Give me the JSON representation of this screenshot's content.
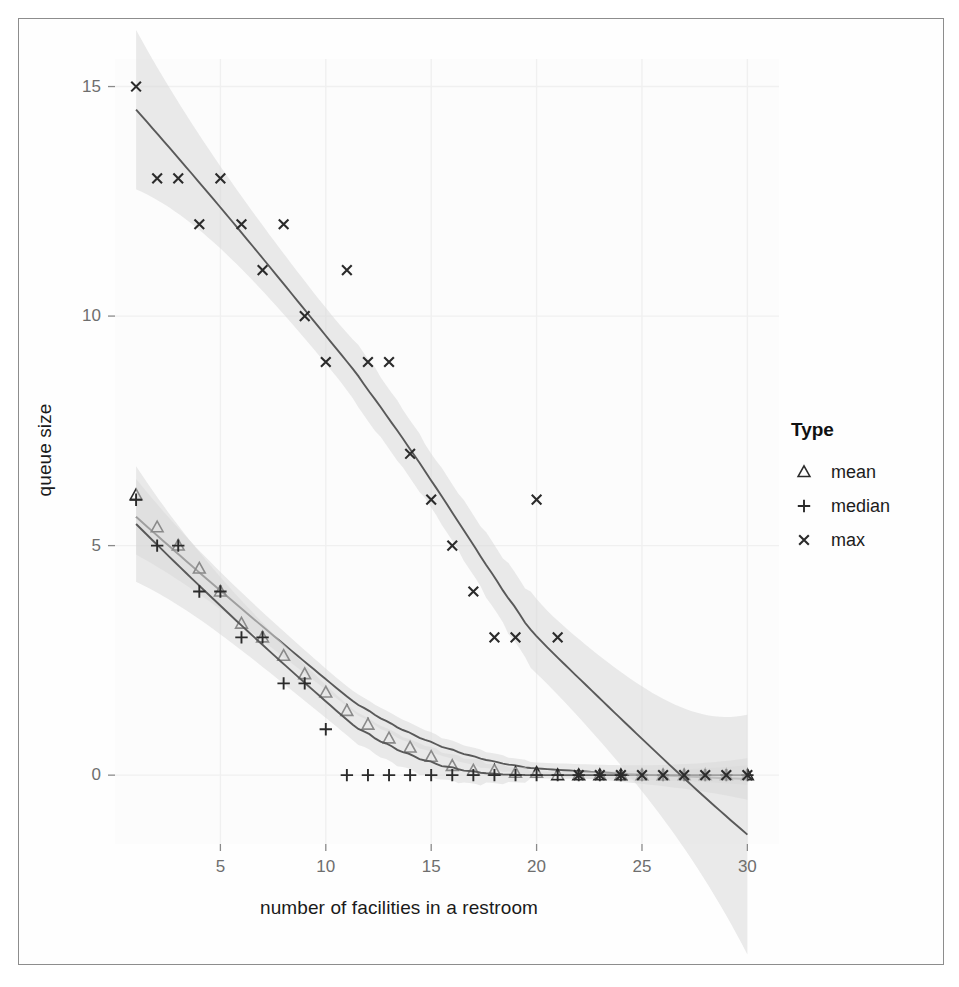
{
  "chart_data": {
    "type": "scatter",
    "title": "",
    "xlabel": "number of facilities in a restroom",
    "ylabel": "queue size",
    "xlim": [
      0,
      31.5
    ],
    "ylim": [
      -1.5,
      15.6
    ],
    "xticks": [
      5,
      10,
      15,
      20,
      25,
      30
    ],
    "yticks": [
      0,
      5,
      10,
      15
    ],
    "grid": true,
    "legend": {
      "title": "Type",
      "position": "right",
      "entries": [
        {
          "label": "mean",
          "marker": "triangle"
        },
        {
          "label": "median",
          "marker": "plus"
        },
        {
          "label": "max",
          "marker": "cross"
        }
      ]
    },
    "x": [
      1,
      2,
      3,
      4,
      5,
      6,
      7,
      8,
      9,
      10,
      11,
      12,
      13,
      14,
      15,
      16,
      17,
      18,
      19,
      20,
      21,
      22,
      23,
      24,
      25,
      26,
      27,
      28,
      29,
      30
    ],
    "series": [
      {
        "name": "mean",
        "marker": "triangle",
        "values": [
          6.1,
          5.4,
          5.0,
          4.5,
          4.0,
          3.3,
          3.0,
          2.6,
          2.2,
          1.8,
          1.4,
          1.1,
          0.8,
          0.6,
          0.4,
          0.2,
          0.1,
          0.1,
          0.05,
          0.05,
          0,
          0,
          0,
          0,
          0,
          0,
          0,
          0,
          0,
          0
        ],
        "smooth_line": true,
        "confidence_band": true
      },
      {
        "name": "median",
        "marker": "plus",
        "values": [
          6.0,
          5.0,
          5.0,
          4.0,
          4.0,
          3.0,
          3.0,
          2.0,
          2.0,
          1.0,
          0,
          0,
          0,
          0,
          0,
          0,
          0,
          0,
          0,
          0,
          0,
          0,
          0,
          0,
          0,
          0,
          0,
          0,
          0,
          0
        ],
        "smooth_line": true,
        "confidence_band": true
      },
      {
        "name": "max",
        "marker": "cross",
        "values": [
          15,
          13,
          13,
          12,
          13,
          12,
          11,
          12,
          10,
          9,
          11,
          9,
          9,
          7,
          6,
          5,
          4,
          3,
          3,
          6,
          3,
          0,
          0,
          0,
          0,
          0,
          0,
          0,
          0,
          0
        ],
        "smooth_line": true,
        "confidence_band": true
      }
    ]
  },
  "style": {
    "panel_background": "#fcfcfc",
    "grid_color": "#f0f0f0",
    "line_color": "#595959",
    "band_color": "#d9d9d9",
    "marker_color": "#2b2b2b",
    "tick_text_color": "#6e6e6e",
    "axis_title_color": "#1a1a1a",
    "frame_color": "#8d8d8d"
  }
}
